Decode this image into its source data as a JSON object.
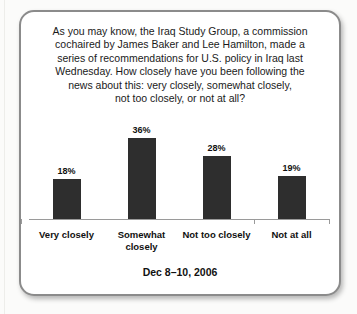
{
  "chart_data": {
    "type": "bar",
    "question_full": "As you may know, the Iraq Study Group, a commission cochaired by James Baker and Lee Hamilton, made a series of recommendations for U.S. policy in Iraq last Wednesday. How closely have you been following the news about this: very closely, somewhat closely, not too closely, or not at all?",
    "question_lines": [
      "As you may know, the Iraq Study Group, a commission",
      "cochaired by James Baker and Lee Hamilton, made a",
      "series of recommendations for U.S. policy in Iraq last",
      "Wednesday. How closely have you been following the",
      "news about this: very closely, somewhat closely,",
      "not too closely, or not at all?"
    ],
    "categories": [
      "Very closely",
      "Somewhat closely",
      "Not too closely",
      "Not at all"
    ],
    "categories_display": [
      "Very closely",
      "Somewhat\nclosely",
      "Not too closely",
      "Not at all"
    ],
    "values": [
      18,
      36,
      28,
      19
    ],
    "value_labels": [
      "18%",
      "36%",
      "28%",
      "19%"
    ],
    "footnote": "Dec 8–10, 2006",
    "ylim": [
      0,
      40
    ],
    "grid": false,
    "legend": "none",
    "bar_color": "#2e2e2e",
    "axis_color": "#9a9a9a"
  }
}
